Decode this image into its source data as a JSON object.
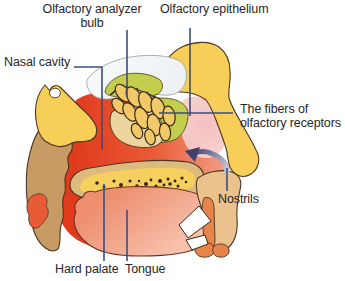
{
  "figure": {
    "type": "anatomical-diagram",
    "labels": {
      "olfactory_bulb_line1": "Olfactory analyzer",
      "olfactory_bulb_line2": "bulb",
      "olfactory_epithelium": "Olfactory epithelium",
      "nasal_cavity": "Nasal cavity",
      "fibers_line1": "The fibers of",
      "fibers_line2": "olfactory receptors",
      "nostrils": "Nostrils",
      "hard_palate": "Hard palate",
      "tongue": "Tongue"
    }
  },
  "colors": {
    "ink": "#2A2627",
    "leader": "#3C4D7E",
    "bone": "#F7CE58",
    "bone-outline": "#4A3722",
    "tan": "#C79B63",
    "red-deep": "#E0391C",
    "red-mid": "#E95A36",
    "red-light": "#F4A78F",
    "pink": "#F3BCBD",
    "pink-light": "#F8D8D1",
    "green": "#C3CE4F",
    "green-outline": "#55511E",
    "brain": "#EEF1F3",
    "brain-outline": "#9FA5AB",
    "beige": "#ECD59E",
    "lobule": "#F1C968",
    "lobule-outline": "#3A2A12",
    "palate-rim": "#DDBA7D",
    "palate-yellow": "#F5D05F",
    "dot": "#33250F",
    "tongue-top": "#EE8F70",
    "tongue-bottom": "#F7C2AD",
    "tongue-outline": "#6E3420",
    "skin": "#EBC28E",
    "orange": "#E88349",
    "tooth": "#FFFFFF",
    "arrow-dark": "#3E4170",
    "arrow-light": "#C7CADD"
  }
}
